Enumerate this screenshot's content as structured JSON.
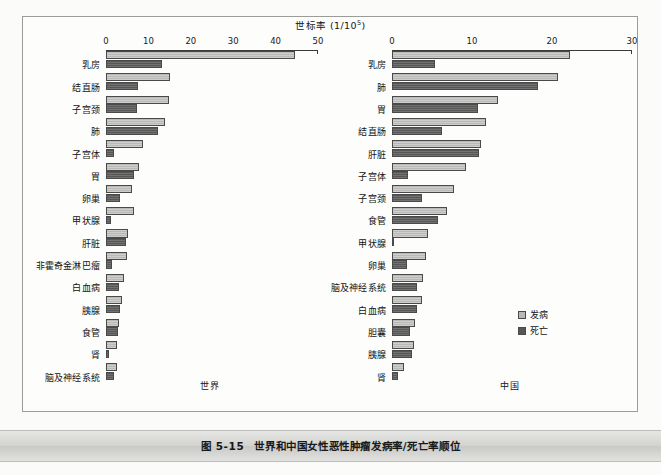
{
  "figure": {
    "caption_number": "图 5-15",
    "caption_title": "世界和中国女性恶性肿瘤发病率/死亡率顺位",
    "axis_title_text": "世标率 (1/10",
    "axis_title_sup": "5",
    "axis_title_tail": ")"
  },
  "legend": {
    "items": [
      {
        "label": "发病",
        "color": "#b9b9b7",
        "key": "incidence"
      },
      {
        "label": "死亡",
        "color": "#575757",
        "key": "mortality"
      }
    ]
  },
  "chart_data": [
    {
      "type": "bar",
      "orientation": "horizontal",
      "panel_id": "world",
      "title": "世界",
      "xlabel": "世标率 (1/10^5)",
      "ylabel": "",
      "xlim": [
        0,
        50
      ],
      "xticks": [
        0,
        10,
        20,
        30,
        40,
        50
      ],
      "xticklabels": [
        "0",
        "10",
        "20",
        "30",
        "40",
        "50"
      ],
      "grid": false,
      "legend_position": "none",
      "categories": [
        "乳房",
        "结直肠",
        "子宫颈",
        "肺",
        "子宫体",
        "胃",
        "卵巢",
        "甲状腺",
        "肝脏",
        "非霍奇金淋巴瘤",
        "白血病",
        "胰腺",
        "食管",
        "肾",
        "脑及神经系统"
      ],
      "series": [
        {
          "name": "发病",
          "values": [
            44.5,
            15.0,
            14.8,
            14.0,
            8.8,
            7.9,
            6.1,
            6.5,
            5.2,
            5.0,
            4.2,
            3.7,
            3.0,
            2.7,
            2.7
          ]
        },
        {
          "name": "死亡",
          "values": [
            13.2,
            7.6,
            7.3,
            12.2,
            1.8,
            6.7,
            3.4,
            1.1,
            4.7,
            1.4,
            3.0,
            3.4,
            2.9,
            0.7,
            2.0
          ]
        }
      ]
    },
    {
      "type": "bar",
      "orientation": "horizontal",
      "panel_id": "china",
      "title": "中国",
      "xlabel": "世标率 (1/10^5)",
      "ylabel": "",
      "xlim": [
        0,
        30
      ],
      "xticks": [
        0,
        10,
        20,
        30
      ],
      "xticklabels": [
        "0",
        "10",
        "20",
        "30"
      ],
      "grid": false,
      "legend_position": "bottom-right",
      "categories": [
        "乳房",
        "肺",
        "胃",
        "结直肠",
        "肝脏",
        "子宫体",
        "子宫颈",
        "食管",
        "甲状腺",
        "卵巢",
        "脑及神经系统",
        "白血病",
        "胆囊",
        "胰腺",
        "肾"
      ],
      "series": [
        {
          "name": "发病",
          "values": [
            22.3,
            20.7,
            13.2,
            11.8,
            11.1,
            9.2,
            7.8,
            6.9,
            4.5,
            4.2,
            3.9,
            3.8,
            2.9,
            2.8,
            1.5
          ]
        },
        {
          "name": "死亡",
          "values": [
            5.4,
            18.3,
            10.7,
            6.3,
            10.9,
            2.0,
            3.7,
            5.8,
            0.3,
            1.9,
            3.1,
            3.1,
            2.3,
            2.5,
            0.7
          ]
        }
      ]
    }
  ]
}
